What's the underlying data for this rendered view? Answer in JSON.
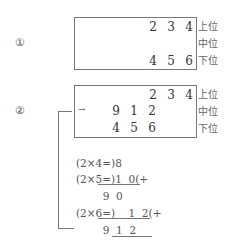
{
  "step1": {
    "label": "①",
    "top_row": [
      "2",
      "3",
      "4"
    ],
    "bottom_row": [
      "4",
      "5",
      "6"
    ],
    "labels": [
      "上位",
      "中位",
      "下位"
    ]
  },
  "step2": {
    "label": "②",
    "top_row": [
      "2",
      "3",
      "4"
    ],
    "middle_row": [
      "9",
      "1",
      "2"
    ],
    "bottom_row": [
      "4",
      "5",
      "6"
    ],
    "labels": [
      "上位",
      "中位",
      "下位"
    ],
    "arrow": "→"
  },
  "calculation": {
    "lines": [
      "(2×4=)8",
      "(2×5=)1  0(+",
      "        9  0",
      "(2×6=)    1  2(+",
      "        9  1  2"
    ]
  }
}
